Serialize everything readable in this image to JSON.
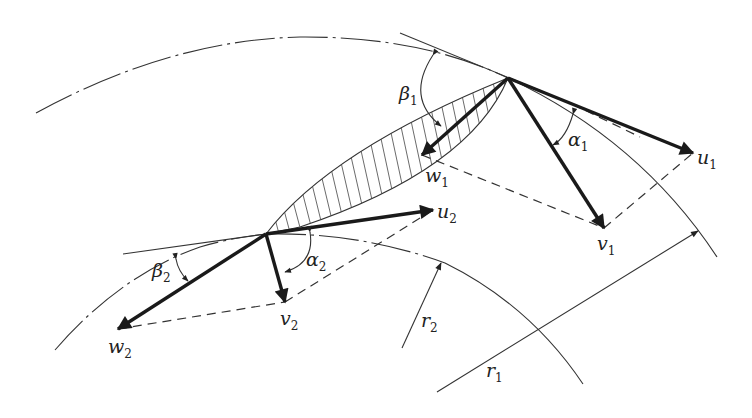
{
  "diagram": {
    "labels": {
      "beta1": {
        "main": "β",
        "sub": "1"
      },
      "alpha1": {
        "main": "α",
        "sub": "1"
      },
      "w1": {
        "main": "w",
        "sub": "1"
      },
      "u1": {
        "main": "u",
        "sub": "1"
      },
      "v1": {
        "main": "v",
        "sub": "1"
      },
      "beta2": {
        "main": "β",
        "sub": "2"
      },
      "alpha2": {
        "main": "α",
        "sub": "2"
      },
      "w2": {
        "main": "w",
        "sub": "2"
      },
      "u2": {
        "main": "u",
        "sub": "2"
      },
      "v2": {
        "main": "v",
        "sub": "2"
      },
      "r1": {
        "main": "r",
        "sub": "1"
      },
      "r2": {
        "main": "r",
        "sub": "2"
      }
    },
    "points": {
      "A_outer_vertex": [
        508,
        78
      ],
      "B_inner_vertex": [
        266,
        234
      ],
      "u1_tip": [
        693,
        153
      ],
      "v1_tip": [
        604,
        228
      ],
      "w1_tip": [
        422,
        155
      ],
      "u2_tip": [
        433,
        210
      ],
      "v2_tip": [
        285,
        302
      ],
      "w2_tip": [
        118,
        329
      ]
    },
    "colors": {
      "ink": "#1a1a1a",
      "background": "#ffffff"
    }
  }
}
